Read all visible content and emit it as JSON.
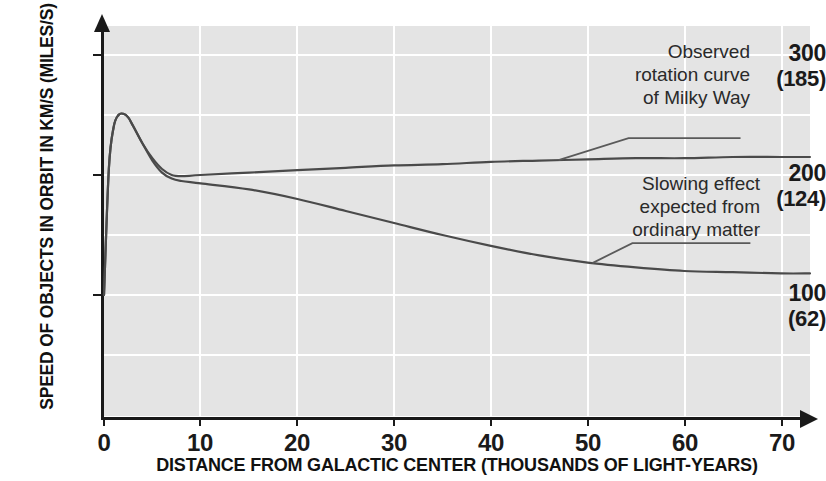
{
  "chart_data": {
    "type": "line",
    "title": "",
    "xlabel": "DISTANCE FROM GALACTIC CENTER (THOUSANDS OF LIGHT-YEARS)",
    "ylabel": "SPEED OF OBJECTS IN ORBIT IN KM/S (MILES/S)",
    "xlim": [
      0,
      73
    ],
    "ylim": [
      0,
      325
    ],
    "grid": true,
    "legend_position": "inline-annotations",
    "xticks": [
      0,
      10,
      20,
      30,
      40,
      50,
      60,
      70
    ],
    "xtick_labels": [
      "0",
      "10",
      "20",
      "30",
      "40",
      "50",
      "60",
      "70"
    ],
    "yticks": [
      100,
      200,
      300
    ],
    "ytick_labels": [
      {
        "primary": "300",
        "secondary": "(185)"
      },
      {
        "primary": "200",
        "secondary": "(124)"
      },
      {
        "primary": "100",
        "secondary": "(62)"
      }
    ],
    "gridlines_y": [
      50,
      100,
      150,
      200,
      250,
      300
    ],
    "gridlines_x": [
      0,
      10,
      20,
      30,
      40,
      50,
      60,
      70
    ],
    "series": [
      {
        "name": "Observed rotation curve of Milky Way",
        "x": [
          0,
          0.5,
          1,
          1.5,
          2,
          2.5,
          3,
          4,
          5,
          6,
          7,
          8,
          10,
          15,
          20,
          25,
          30,
          35,
          40,
          45,
          50,
          55,
          60,
          65,
          70,
          73
        ],
        "values": [
          100,
          205,
          240,
          250,
          251,
          248,
          241,
          226,
          214,
          205,
          200,
          199,
          200,
          202,
          204,
          206,
          208,
          209,
          211,
          212,
          213,
          214,
          214,
          215,
          215,
          215
        ]
      },
      {
        "name": "Slowing effect expected from ordinary matter",
        "x": [
          0,
          0.5,
          1,
          1.5,
          2,
          2.5,
          3,
          4,
          5,
          6,
          7,
          8,
          10,
          15,
          20,
          25,
          30,
          35,
          40,
          45,
          50,
          55,
          60,
          65,
          70,
          73
        ],
        "values": [
          100,
          205,
          240,
          250,
          251,
          248,
          241,
          226,
          212,
          202,
          197,
          195,
          193,
          188,
          180,
          170,
          160,
          150,
          141,
          133,
          127,
          123,
          120,
          119,
          118,
          118
        ]
      }
    ],
    "annotations": [
      {
        "id": "observed",
        "text_lines": [
          "Observed",
          "rotation curve",
          "of Milky Way"
        ],
        "points_to_series": "Observed rotation curve of Milky Way",
        "anchor_x": 47
      },
      {
        "id": "ordinary",
        "text_lines": [
          "Slowing effect",
          "expected from",
          "ordinary matter"
        ],
        "points_to_series": "Slowing effect expected from ordinary matter",
        "anchor_x": 50.5
      }
    ],
    "colors": {
      "plot_background": "#e4e4e4",
      "gridline": "#ffffff",
      "axis": "#1a1a1a",
      "curve": "#4a4a4a",
      "text": "#1a1a1a",
      "annotation_text": "#2a2a2a"
    }
  }
}
